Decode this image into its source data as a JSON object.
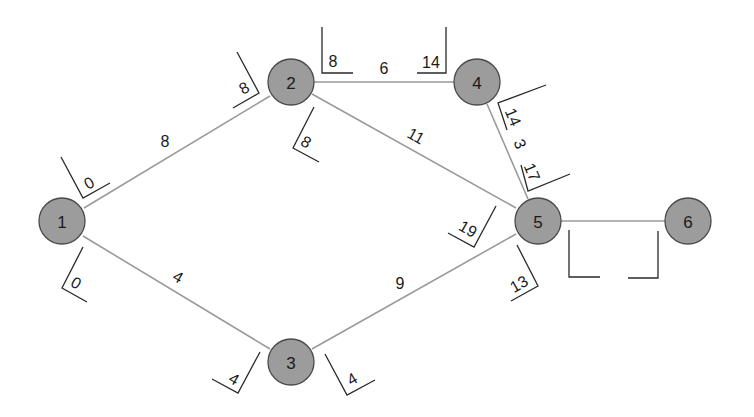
{
  "diagram": {
    "type": "network / activity-on-node critical path diagram",
    "nodes": [
      {
        "id": "1",
        "label": "1",
        "x": 62,
        "y": 221
      },
      {
        "id": "2",
        "label": "2",
        "x": 291,
        "y": 82
      },
      {
        "id": "3",
        "label": "3",
        "x": 291,
        "y": 362
      },
      {
        "id": "4",
        "label": "4",
        "x": 477,
        "y": 82
      },
      {
        "id": "5",
        "label": "5",
        "x": 538,
        "y": 221
      },
      {
        "id": "6",
        "label": "6",
        "x": 688,
        "y": 221
      }
    ],
    "edges": [
      {
        "from": "1",
        "to": "2",
        "weight": "8"
      },
      {
        "from": "1",
        "to": "3",
        "weight": "4"
      },
      {
        "from": "2",
        "to": "4",
        "weight": "6"
      },
      {
        "from": "2",
        "to": "5",
        "weight": "11"
      },
      {
        "from": "3",
        "to": "5",
        "weight": "9"
      },
      {
        "from": "4",
        "to": "5",
        "weight": "3"
      },
      {
        "from": "5",
        "to": "6",
        "weight": ""
      }
    ],
    "time_boxes": [
      {
        "edge": "1-2",
        "end": "1",
        "value": "0"
      },
      {
        "edge": "1-2",
        "end": "2",
        "value": "8"
      },
      {
        "edge": "1-3",
        "end": "1",
        "value": "0"
      },
      {
        "edge": "1-3",
        "end": "3",
        "value": "4"
      },
      {
        "edge": "2-4",
        "end": "2",
        "value": "8"
      },
      {
        "edge": "2-4",
        "end": "4",
        "value": "14"
      },
      {
        "edge": "2-5",
        "end": "2",
        "value": "8"
      },
      {
        "edge": "2-5",
        "end": "5",
        "value": "19"
      },
      {
        "edge": "3-5",
        "end": "3",
        "value": "4"
      },
      {
        "edge": "3-5",
        "end": "5",
        "value": "13"
      },
      {
        "edge": "4-5",
        "end": "4",
        "value": "14"
      },
      {
        "edge": "4-5",
        "end": "5",
        "value": "17"
      },
      {
        "edge": "5-6",
        "end": "5",
        "value": ""
      },
      {
        "edge": "5-6",
        "end": "6",
        "value": ""
      }
    ]
  },
  "labels": {
    "node_1": "1",
    "node_2": "2",
    "node_3": "3",
    "node_4": "4",
    "node_5": "5",
    "node_6": "6",
    "edge_1_2": "8",
    "edge_1_3": "4",
    "edge_2_4": "6",
    "edge_2_5": "11",
    "edge_3_5": "9",
    "edge_4_5": "3",
    "box_1_2_start": "0",
    "box_1_2_end": "8",
    "box_1_3_start": "0",
    "box_1_3_end": "4",
    "box_2_4_start": "8",
    "box_2_4_end": "14",
    "box_2_5_start": "8",
    "box_2_5_end": "19",
    "box_3_5_start": "4",
    "box_3_5_end": "13",
    "box_4_5_start": "14",
    "box_4_5_end": "17",
    "box_5_6_start": "",
    "box_5_6_end": ""
  },
  "colors": {
    "background": "#ffffff",
    "node_fill": "#9c9c9c",
    "node_stroke": "#4a4a4a",
    "edge": "#9a9a9a",
    "text": "#1a1a1a"
  }
}
